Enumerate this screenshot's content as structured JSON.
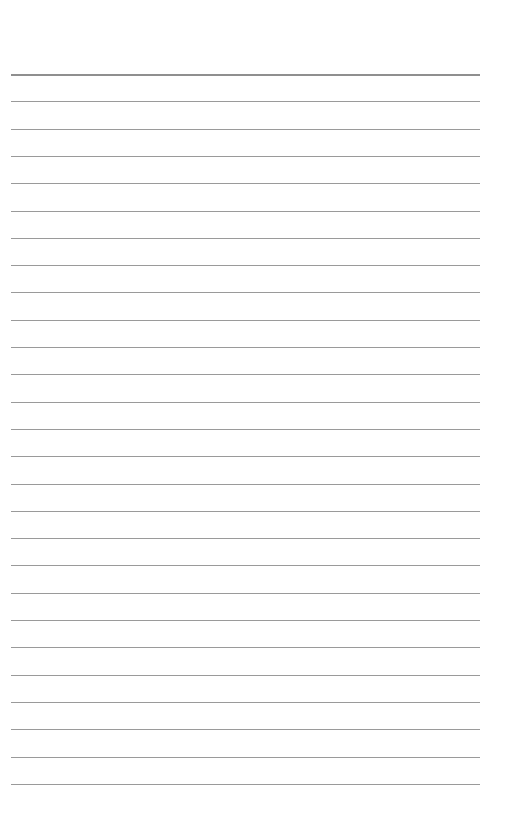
{
  "page": {
    "type": "lined-paper",
    "background": "#ffffff",
    "rule_color": "#9a9a9a",
    "header_rule_color": "#8f8f8f",
    "first_rule_y": 74,
    "line_spacing": 27.3,
    "rule_count": 27,
    "text": ""
  }
}
